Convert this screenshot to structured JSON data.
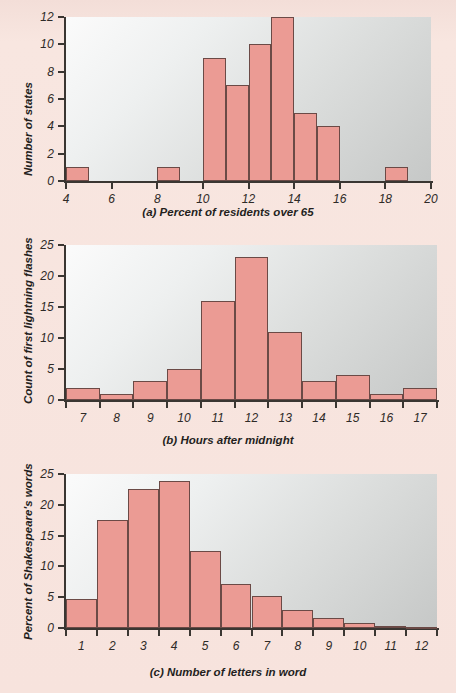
{
  "page": {
    "background_color": "#f7e3dd",
    "bar_fill_color": "#eb9b94",
    "bar_border_color": "#6b4a46",
    "axis_color": "#3a3632",
    "plot_bg_light": "#fbfbfb",
    "plot_bg_dark": "#c6c8c7"
  },
  "charts": [
    {
      "id": "a",
      "type": "bar",
      "title": "(a) Percent of residents over 65",
      "xlabel": "(a) Percent of residents over 65",
      "ylabel": "Number of states",
      "xlim": [
        4,
        20
      ],
      "ylim": [
        0,
        12
      ],
      "xticks": [
        4,
        6,
        8,
        10,
        12,
        14,
        16,
        18,
        20
      ],
      "xtick_labels": [
        "4",
        "6",
        "8",
        "10",
        "12",
        "14",
        "16",
        "18",
        "20"
      ],
      "yticks": [
        0,
        2,
        4,
        6,
        8,
        10,
        12
      ],
      "ytick_labels": [
        "0",
        "2",
        "4",
        "6",
        "8",
        "10",
        "12"
      ],
      "bin_width": 1,
      "bins": [
        {
          "start": 4,
          "end": 5,
          "value": 1
        },
        {
          "start": 8,
          "end": 9,
          "value": 1
        },
        {
          "start": 10,
          "end": 11,
          "value": 9
        },
        {
          "start": 11,
          "end": 12,
          "value": 7
        },
        {
          "start": 12,
          "end": 13,
          "value": 10
        },
        {
          "start": 13,
          "end": 14,
          "value": 12
        },
        {
          "start": 14,
          "end": 15,
          "value": 5
        },
        {
          "start": 15,
          "end": 16,
          "value": 4
        },
        {
          "start": 18,
          "end": 19,
          "value": 1
        }
      ],
      "grid": false,
      "legend": "none"
    },
    {
      "id": "b",
      "type": "bar",
      "title": "(b) Hours after midnight",
      "xlabel": "(b) Hours after midnight",
      "ylabel": "Count of first lightning flashes",
      "xlim": [
        6.5,
        17.5
      ],
      "ylim": [
        0,
        25
      ],
      "xticks": [
        7,
        8,
        9,
        10,
        11,
        12,
        13,
        14,
        15,
        16,
        17
      ],
      "xtick_labels": [
        "7",
        "8",
        "9",
        "10",
        "11",
        "12",
        "13",
        "14",
        "15",
        "16",
        "17"
      ],
      "yticks": [
        0,
        5,
        10,
        15,
        20,
        25
      ],
      "ytick_labels": [
        "0",
        "5",
        "10",
        "15",
        "20",
        "25"
      ],
      "bin_width": 1,
      "categories": [
        7,
        8,
        9,
        10,
        11,
        12,
        13,
        14,
        15,
        16,
        17
      ],
      "values": [
        2,
        1,
        3,
        5,
        16,
        23,
        11,
        3,
        4,
        1,
        2
      ],
      "grid": false,
      "legend": "none"
    },
    {
      "id": "c",
      "type": "bar",
      "title": "(c) Number of letters in word",
      "xlabel": "(c) Number of letters in word",
      "ylabel": "Percent of Shakespeare's words",
      "xlim": [
        0.5,
        12.5
      ],
      "ylim": [
        0,
        25
      ],
      "xticks": [
        1,
        2,
        3,
        4,
        5,
        6,
        7,
        8,
        9,
        10,
        11,
        12
      ],
      "xtick_labels": [
        "1",
        "2",
        "3",
        "4",
        "5",
        "6",
        "7",
        "8",
        "9",
        "10",
        "11",
        "12"
      ],
      "yticks": [
        0,
        5,
        10,
        15,
        20,
        25
      ],
      "ytick_labels": [
        "0",
        "5",
        "10",
        "15",
        "20",
        "25"
      ],
      "bin_width": 1,
      "categories": [
        1,
        2,
        3,
        4,
        5,
        6,
        7,
        8,
        9,
        10,
        11,
        12
      ],
      "values": [
        4.7,
        17.6,
        22.5,
        23.9,
        12.5,
        7.1,
        5.2,
        3.0,
        1.7,
        0.8,
        0.3,
        0.2
      ],
      "grid": false,
      "legend": "none"
    }
  ],
  "chart_data": [
    {
      "type": "bar",
      "title": "(a) Percent of residents over 65",
      "xlabel": "(a) Percent of residents over 65",
      "ylabel": "Number of states",
      "categories": [
        "4-5",
        "5-6",
        "6-7",
        "7-8",
        "8-9",
        "9-10",
        "10-11",
        "11-12",
        "12-13",
        "13-14",
        "14-15",
        "15-16",
        "16-17",
        "17-18",
        "18-19",
        "19-20"
      ],
      "values": [
        1,
        0,
        0,
        0,
        1,
        0,
        9,
        7,
        10,
        12,
        5,
        4,
        0,
        0,
        1,
        0
      ],
      "xlim": [
        4,
        20
      ],
      "ylim": [
        0,
        12
      ],
      "grid": false,
      "legend": "none"
    },
    {
      "type": "bar",
      "title": "(b) Hours after midnight",
      "xlabel": "(b) Hours after midnight",
      "ylabel": "Count of first lightning flashes",
      "categories": [
        "7",
        "8",
        "9",
        "10",
        "11",
        "12",
        "13",
        "14",
        "15",
        "16",
        "17"
      ],
      "values": [
        2,
        1,
        3,
        5,
        16,
        23,
        11,
        3,
        4,
        1,
        2
      ],
      "xlim": [
        6.5,
        17.5
      ],
      "ylim": [
        0,
        25
      ],
      "grid": false,
      "legend": "none"
    },
    {
      "type": "bar",
      "title": "(c) Number of letters in word",
      "xlabel": "(c) Number of letters in word",
      "ylabel": "Percent of Shakespeare's words",
      "categories": [
        "1",
        "2",
        "3",
        "4",
        "5",
        "6",
        "7",
        "8",
        "9",
        "10",
        "11",
        "12"
      ],
      "values": [
        4.7,
        17.6,
        22.5,
        23.9,
        12.5,
        7.1,
        5.2,
        3.0,
        1.7,
        0.8,
        0.3,
        0.2
      ],
      "xlim": [
        0.5,
        12.5
      ],
      "ylim": [
        0,
        25
      ],
      "grid": false,
      "legend": "none"
    }
  ]
}
